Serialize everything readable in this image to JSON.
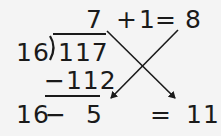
{
  "division": {
    "divisor": "16",
    "dividend": "117",
    "quotient": "7",
    "product": "−112",
    "remainder": "5"
  },
  "top_expression": {
    "plus": "+",
    "one": "1",
    "equals": "=",
    "result": "8"
  },
  "bottom_expression": {
    "minuend": "16",
    "minus": "−",
    "equals": "=",
    "result": "11"
  },
  "colors": {
    "ink": "#1a1a1a",
    "background": "#f4f4f4"
  }
}
